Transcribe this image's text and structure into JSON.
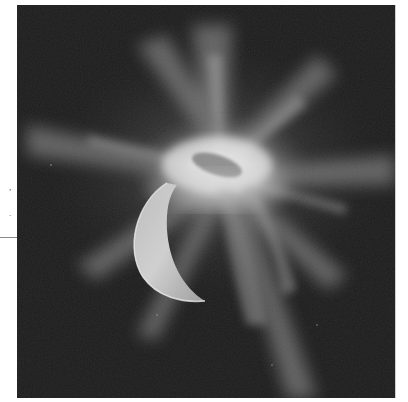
{
  "page": {
    "margin_fragments": [
      ",",
      "."
    ],
    "rule_visible": true
  },
  "image": {
    "subject": "bright debris plume with radiating rays above a sunlit crescent body against a dark background",
    "colors": {
      "background": "#1b1b1b",
      "plume_core": "#f2f2f2",
      "plume_glow": "#9a9a9a",
      "crescent": "#c8c8c8",
      "crescent_edge": "#eeeeee",
      "page": "#ffffff"
    }
  }
}
